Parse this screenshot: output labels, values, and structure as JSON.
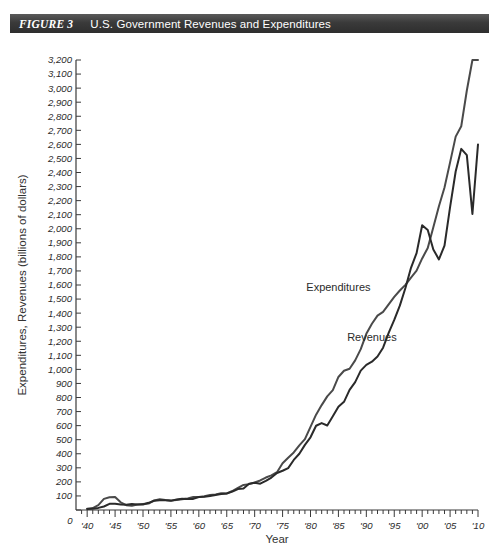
{
  "figure": {
    "number_label": "FIGURE 3",
    "title": "U.S. Government Revenues and Expenditures"
  },
  "chart_data": {
    "type": "line",
    "title": "U.S. Government Revenues and Expenditures",
    "xlabel": "Year",
    "ylabel": "Expenditures, Revenues (billions of dollars)",
    "xlim": [
      1938,
      2010
    ],
    "ylim": [
      0,
      3200
    ],
    "grid": false,
    "legend_position": "inline-annotation",
    "y_tick_labels": [
      "0",
      "100",
      "200",
      "300",
      "400",
      "500",
      "600",
      "700",
      "800",
      "900",
      "1,000",
      "1,100",
      "1,200",
      "1,300",
      "1,400",
      "1,500",
      "1,600",
      "1,700",
      "1,800",
      "1,900",
      "2,000",
      "2,100",
      "2,200",
      "2,300",
      "2,400",
      "2,500",
      "2,600",
      "2,700",
      "2,800",
      "2,900",
      "3,000",
      "3,100",
      "3,200"
    ],
    "y_tick_values": [
      0,
      100,
      200,
      300,
      400,
      500,
      600,
      700,
      800,
      900,
      1000,
      1100,
      1200,
      1300,
      1400,
      1500,
      1600,
      1700,
      1800,
      1900,
      2000,
      2100,
      2200,
      2300,
      2400,
      2500,
      2600,
      2700,
      2800,
      2900,
      3000,
      3100,
      3200
    ],
    "x_origin_label": "0",
    "x_tick_labels": [
      "'40",
      "'45",
      "'50",
      "'55",
      "'60",
      "'65",
      "'70",
      "'75",
      "'80",
      "'85",
      "'90",
      "'95",
      "'00",
      "'05",
      "'10"
    ],
    "x_tick_values": [
      1940,
      1945,
      1950,
      1955,
      1960,
      1965,
      1970,
      1975,
      1980,
      1985,
      1990,
      1995,
      2000,
      2005,
      2010
    ],
    "x_minor_step": 1,
    "series": [
      {
        "name": "Expenditures",
        "color": "#4a4a4a",
        "label_x": 1985,
        "label_y": 1560,
        "x": [
          1940,
          1941,
          1942,
          1943,
          1944,
          1945,
          1946,
          1947,
          1948,
          1949,
          1950,
          1951,
          1952,
          1953,
          1954,
          1955,
          1956,
          1957,
          1958,
          1959,
          1960,
          1961,
          1962,
          1963,
          1964,
          1965,
          1966,
          1967,
          1968,
          1969,
          1970,
          1971,
          1972,
          1973,
          1974,
          1975,
          1976,
          1977,
          1978,
          1979,
          1980,
          1981,
          1982,
          1983,
          1984,
          1985,
          1986,
          1987,
          1988,
          1989,
          1990,
          1991,
          1992,
          1993,
          1994,
          1995,
          1996,
          1997,
          1998,
          1999,
          2000,
          2001,
          2002,
          2003,
          2004,
          2005,
          2006,
          2007,
          2008,
          2009,
          2010
        ],
        "values": [
          9,
          14,
          35,
          79,
          91,
          93,
          55,
          34,
          30,
          39,
          43,
          46,
          68,
          76,
          71,
          68,
          71,
          77,
          82,
          92,
          92,
          98,
          107,
          111,
          119,
          118,
          135,
          158,
          178,
          184,
          196,
          210,
          231,
          246,
          269,
          332,
          372,
          409,
          459,
          504,
          591,
          678,
          746,
          808,
          852,
          946,
          990,
          1004,
          1064,
          1144,
          1253,
          1324,
          1382,
          1409,
          1462,
          1516,
          1561,
          1601,
          1653,
          1702,
          1789,
          1863,
          2011,
          2160,
          2293,
          2472,
          2655,
          2729,
          2983,
          3518,
          3456
        ],
        "note": "rises steeply after 1970; crosses above revenues in the early 1980s; peaks near 3,150 at 2010"
      },
      {
        "name": "Revenues",
        "color": "#2a2a2a",
        "label_x": 1991,
        "label_y": 1200,
        "x": [
          1940,
          1941,
          1942,
          1943,
          1944,
          1945,
          1946,
          1947,
          1948,
          1949,
          1950,
          1951,
          1952,
          1953,
          1954,
          1955,
          1956,
          1957,
          1958,
          1959,
          1960,
          1961,
          1962,
          1963,
          1964,
          1965,
          1966,
          1967,
          1968,
          1969,
          1970,
          1971,
          1972,
          1973,
          1974,
          1975,
          1976,
          1977,
          1978,
          1979,
          1980,
          1981,
          1982,
          1983,
          1984,
          1985,
          1986,
          1987,
          1988,
          1989,
          1990,
          1991,
          1992,
          1993,
          1994,
          1995,
          1996,
          1997,
          1998,
          1999,
          2000,
          2001,
          2002,
          2003,
          2004,
          2005,
          2006,
          2007,
          2008,
          2009,
          2010
        ],
        "values": [
          7,
          9,
          15,
          25,
          44,
          45,
          39,
          38,
          42,
          39,
          39,
          51,
          66,
          70,
          70,
          65,
          75,
          80,
          79,
          79,
          92,
          94,
          100,
          107,
          113,
          117,
          131,
          149,
          153,
          187,
          193,
          187,
          207,
          231,
          263,
          279,
          298,
          356,
          400,
          463,
          517,
          599,
          618,
          601,
          666,
          734,
          769,
          854,
          909,
          991,
          1032,
          1055,
          1091,
          1154,
          1259,
          1352,
          1453,
          1579,
          1722,
          1827,
          2025,
          1991,
          1853,
          1782,
          1880,
          2154,
          2407,
          2568,
          2524,
          2105,
          2600
        ],
        "note": "peaks near 2,030 at 2000, dips to about 1,780 by 2003, rebounds to about 2,570 by 2007, dips again near 2009, ends about 2,650"
      }
    ]
  }
}
